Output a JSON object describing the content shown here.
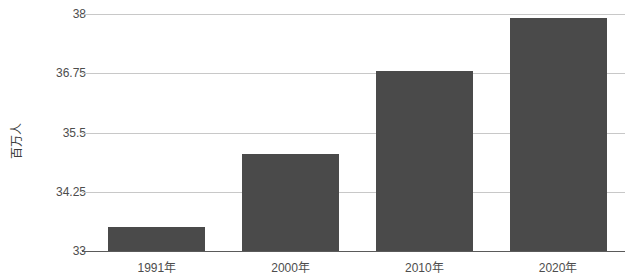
{
  "chart_data": {
    "type": "bar",
    "title": "",
    "subtitle": "",
    "xlabel": "",
    "ylabel": "百万人",
    "categories": [
      "1991年",
      "2000年",
      "2010年",
      "2020年"
    ],
    "values": [
      33.5,
      35.05,
      36.8,
      37.92
    ],
    "series": [
      {
        "name": "人口",
        "values": [
          33.5,
          35.05,
          36.8,
          37.92
        ]
      }
    ],
    "ylim": [
      33,
      38
    ],
    "yticks": [
      33,
      34.25,
      35.5,
      36.75,
      38
    ],
    "ytick_labels": [
      "33",
      "34.25",
      "35.5",
      "36.75",
      "38"
    ],
    "grid": true,
    "legend": false,
    "legend_position": "none",
    "annotations": [],
    "bar_color": "#4a4a4a",
    "gridline_color": "#c8c8c8",
    "axis_color": "#5a5a5a",
    "background_color": "#ffffff",
    "text_color": "#4d4d4d"
  }
}
